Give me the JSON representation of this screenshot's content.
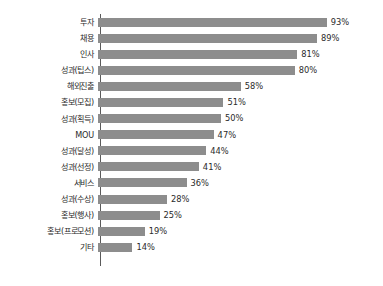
{
  "chart_data": {
    "type": "bar",
    "orientation": "horizontal",
    "title": "",
    "subtitle": "",
    "xlabel": "",
    "ylabel": "",
    "xlim": [
      0,
      100
    ],
    "grid": false,
    "legend": null,
    "value_suffix": "%",
    "bar_color": "#8d8d8d",
    "axis_color": "#5a5a5a",
    "categories": [
      "투자",
      "채용",
      "인사",
      "성과(팁스)",
      "해외진출",
      "홍보(모집)",
      "성과(획득)",
      "MOU",
      "성과(달성)",
      "성과(선정)",
      "서비스",
      "성과(수상)",
      "홍보(행사)",
      "홍보(프로모션)",
      "기타"
    ],
    "values": [
      93,
      89,
      81,
      80,
      58,
      51,
      50,
      47,
      44,
      41,
      36,
      28,
      25,
      19,
      14
    ],
    "data_labels": [
      "93%",
      "89%",
      "81%",
      "80%",
      "58%",
      "51%",
      "50%",
      "47%",
      "44%",
      "41%",
      "36%",
      "28%",
      "25%",
      "19%",
      "14%"
    ]
  }
}
